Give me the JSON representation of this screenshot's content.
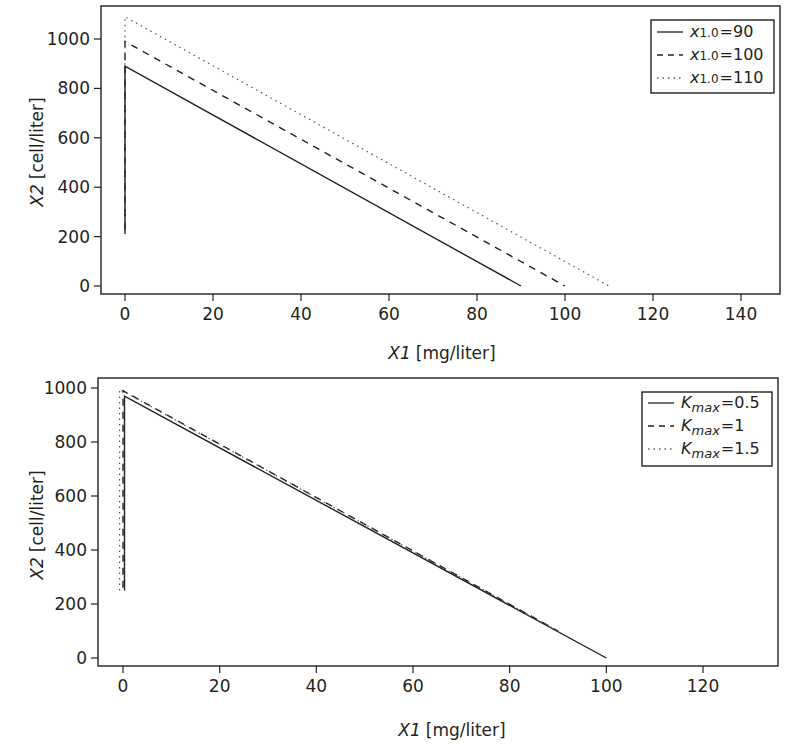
{
  "chart_data": [
    {
      "type": "line",
      "title": "",
      "xlabel": "X1 [mg/liter]",
      "xlabel_var": "X1",
      "xlabel_unit": "[mg/liter]",
      "ylabel": "X2 [cell/liter]",
      "ylabel_var": "X2",
      "ylabel_unit": "[cell/liter]",
      "xlim": [
        -5,
        150
      ],
      "ylim": [
        -30,
        1120
      ],
      "xticks": [
        0,
        20,
        40,
        60,
        80,
        100,
        120,
        140
      ],
      "yticks": [
        0,
        200,
        400,
        600,
        800,
        1000
      ],
      "grid": false,
      "legend_position": "upper right",
      "series": [
        {
          "name": "x1.0=90",
          "legend_sub": "1.0",
          "legend_value": "=90",
          "style": "solid",
          "x": [
            0,
            0,
            90
          ],
          "y": [
            210,
            890,
            0
          ]
        },
        {
          "name": "x1.0=100",
          "legend_sub": "1.0",
          "legend_value": "=100",
          "style": "dashed",
          "x": [
            0,
            0,
            100
          ],
          "y": [
            230,
            990,
            0
          ]
        },
        {
          "name": "x1.0=110",
          "legend_sub": "1.0",
          "legend_value": "=110",
          "style": "dotted",
          "x": [
            0,
            0,
            110
          ],
          "y": [
            250,
            1090,
            0
          ]
        }
      ]
    },
    {
      "type": "line",
      "title": "",
      "xlabel": "X1 [mg/liter]",
      "xlabel_var": "X1",
      "xlabel_unit": "[mg/liter]",
      "ylabel": "X2 [cell/liter]",
      "ylabel_var": "X2",
      "ylabel_unit": "[cell/liter]",
      "xlim": [
        -5,
        135
      ],
      "ylim": [
        -30,
        1040
      ],
      "xticks": [
        0,
        20,
        40,
        60,
        80,
        100,
        120
      ],
      "yticks": [
        0,
        200,
        400,
        600,
        800,
        1000
      ],
      "grid": false,
      "legend_position": "upper right",
      "series": [
        {
          "name": "Kmax=0.5",
          "legend_sub": "max",
          "legend_value": "=0.5",
          "style": "solid",
          "x": [
            0.3,
            0.3,
            100
          ],
          "y": [
            250,
            970,
            0
          ]
        },
        {
          "name": "Kmax=1",
          "legend_sub": "max",
          "legend_value": "=1",
          "style": "dashed",
          "x": [
            0,
            0,
            90
          ],
          "y": [
            260,
            990,
            100
          ]
        },
        {
          "name": "Kmax=1.5",
          "legend_sub": "max",
          "legend_value": "=1.5",
          "style": "dotted",
          "x": [
            -0.7,
            -0.7,
            90
          ],
          "y": [
            250,
            995,
            100
          ]
        }
      ]
    }
  ]
}
